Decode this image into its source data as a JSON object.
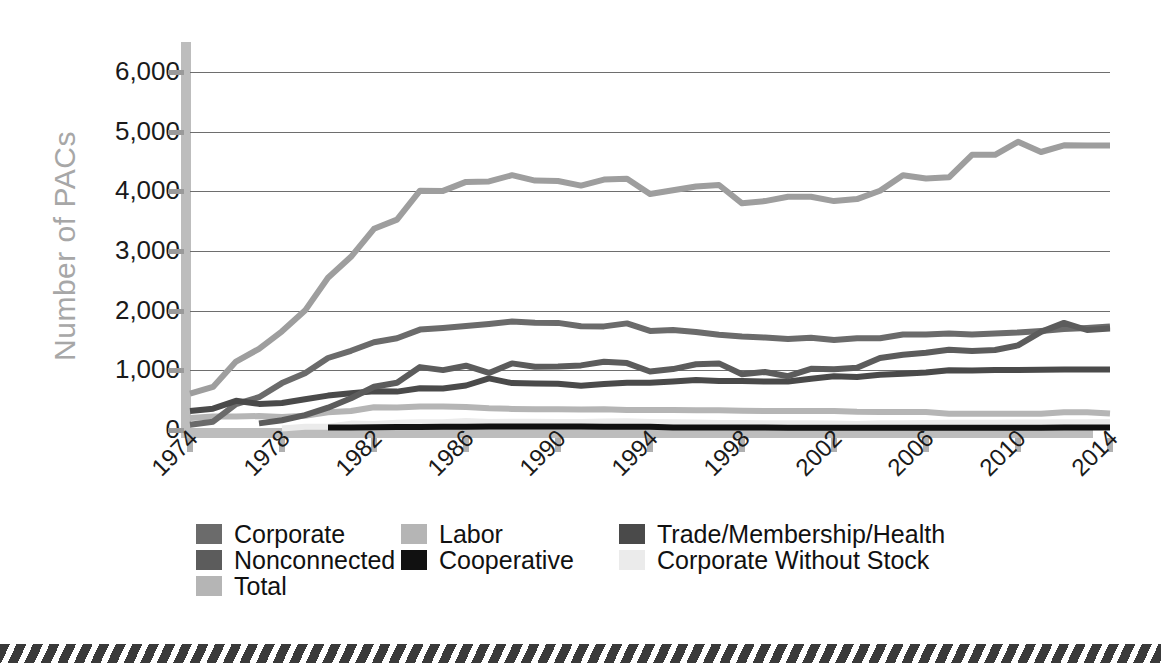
{
  "chart_data": {
    "type": "line",
    "title": "",
    "xlabel": "",
    "ylabel": "Number of PACs",
    "ylim": [
      0,
      6500
    ],
    "yticks": [
      0,
      1000,
      2000,
      3000,
      4000,
      5000,
      6000
    ],
    "ytick_labels": [
      "0",
      "1,000",
      "2,000",
      "3,000",
      "4,000",
      "5,000",
      "6,000"
    ],
    "xlim": [
      1974,
      2014
    ],
    "xticks": [
      1974,
      1978,
      1982,
      1986,
      1990,
      1994,
      1998,
      2002,
      2006,
      2010,
      2014
    ],
    "xtick_labels": [
      "1974",
      "1978",
      "1982",
      "1986",
      "1990",
      "1994",
      "1998",
      "2002",
      "2006",
      "2010",
      "2014"
    ],
    "grid": "horizontal",
    "legend_position": "bottom-left",
    "x": [
      1974,
      1975,
      1976,
      1977,
      1978,
      1979,
      1980,
      1981,
      1982,
      1983,
      1984,
      1985,
      1986,
      1987,
      1988,
      1989,
      1990,
      1991,
      1992,
      1993,
      1994,
      1995,
      1996,
      1997,
      1998,
      1999,
      2000,
      2001,
      2002,
      2003,
      2004,
      2005,
      2006,
      2007,
      2008,
      2009,
      2010,
      2011,
      2012,
      2013,
      2014
    ],
    "series": [
      {
        "name": "Corporate",
        "color": "#6b6b6b",
        "values": [
          89,
          139,
          433,
          550,
          785,
          950,
          1206,
          1327,
          1469,
          1538,
          1682,
          1710,
          1744,
          1775,
          1816,
          1796,
          1795,
          1738,
          1735,
          1785,
          1660,
          1674,
          1642,
          1597,
          1567,
          1548,
          1523,
          1545,
          1508,
          1538,
          1538,
          1600,
          1598,
          1617,
          1598,
          1617,
          1634,
          1660,
          1690,
          1708,
          1735
        ]
      },
      {
        "name": "Labor",
        "color": "#b5b5b5",
        "values": [
          201,
          226,
          224,
          234,
          217,
          240,
          297,
          318,
          380,
          378,
          394,
          394,
          384,
          364,
          354,
          349,
          346,
          345,
          347,
          337,
          333,
          334,
          332,
          332,
          321,
          318,
          316,
          317,
          320,
          305,
          302,
          303,
          300,
          273,
          272,
          272,
          273,
          272,
          296,
          298,
          274
        ]
      },
      {
        "name": "Trade/Membership/Health",
        "color": "#4a4a4a",
        "values": [
          318,
          357,
          489,
          438,
          453,
          514,
          576,
          614,
          649,
          644,
          698,
          695,
          745,
          865,
          786,
          777,
          774,
          742,
          770,
          793,
          792,
          815,
          838,
          821,
          821,
          812,
          812,
          860,
          900,
          890,
          926,
          942,
          963,
          1001,
          995,
          1003,
          1006,
          1008,
          1013,
          1012,
          1014
        ]
      },
      {
        "name": "Nonconnected",
        "color": "#5c5c5c",
        "values": [
          0,
          0,
          0,
          110,
          162,
          250,
          374,
          531,
          723,
          793,
          1053,
          1003,
          1077,
          957,
          1115,
          1060,
          1062,
          1083,
          1145,
          1121,
          980,
          1020,
          1103,
          1115,
          935,
          972,
          902,
          1026,
          1018,
          1043,
          1206,
          1259,
          1294,
          1345,
          1321,
          1341,
          1417,
          1644,
          1794,
          1675,
          1700
        ]
      },
      {
        "name": "Cooperative",
        "color": "#111111",
        "values": [
          0,
          0,
          0,
          0,
          0,
          0,
          42,
          41,
          47,
          51,
          52,
          54,
          56,
          59,
          59,
          59,
          59,
          57,
          56,
          56,
          53,
          44,
          42,
          42,
          41,
          41,
          38,
          38,
          39,
          38,
          38,
          38,
          38,
          39,
          38,
          38,
          38,
          38,
          40,
          40,
          40
        ]
      },
      {
        "name": "Corporate Without Stock",
        "color": "#ebebeb",
        "values": [
          0,
          0,
          0,
          0,
          24,
          56,
          56,
          108,
          103,
          122,
          130,
          131,
          151,
          136,
          138,
          137,
          136,
          136,
          142,
          146,
          136,
          129,
          126,
          119,
          115,
          114,
          114,
          113,
          110,
          103,
          114,
          114,
          118,
          121,
          121,
          123,
          128,
          127,
          130,
          130,
          132
        ]
      },
      {
        "name": "Total",
        "color": "#9e9e9e",
        "values": [
          608,
          722,
          1146,
          1360,
          1653,
          2000,
          2551,
          2901,
          3371,
          3525,
          4009,
          4006,
          4157,
          4165,
          4268,
          4178,
          4172,
          4094,
          4195,
          4210,
          3954,
          4016,
          4079,
          4105,
          3798,
          3835,
          3907,
          3907,
          3835,
          3868,
          4009,
          4268,
          4214,
          4234,
          4611,
          4611,
          4828,
          4657,
          4769,
          4767,
          4767
        ]
      }
    ]
  },
  "legend": {
    "rows": [
      [
        {
          "label": "Corporate",
          "color": "#6b6b6b"
        },
        {
          "label": "Labor",
          "color": "#b5b5b5"
        },
        {
          "label": "Trade/Membership/Health",
          "color": "#4a4a4a"
        }
      ],
      [
        {
          "label": "Nonconnected",
          "color": "#5c5c5c"
        },
        {
          "label": "Cooperative",
          "color": "#111111"
        },
        {
          "label": "Corporate Without Stock",
          "color": "#ebebeb"
        }
      ],
      [
        {
          "label": "Total",
          "color": "#b5b5b5"
        }
      ]
    ]
  }
}
